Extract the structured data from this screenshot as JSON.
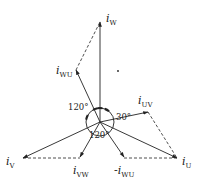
{
  "diagram": {
    "origin": [
      100,
      122
    ],
    "angle_circle_radius": 14,
    "colors": {
      "line": "#222222",
      "background": "#ffffff"
    },
    "phasors": [
      {
        "id": "iW",
        "main": "i",
        "sub": "W",
        "prefix": "",
        "tip": [
          100,
          22
        ],
        "label_pos": [
          106,
          22
        ],
        "style": "solid"
      },
      {
        "id": "iWU",
        "main": "i",
        "sub": "WU",
        "prefix": "",
        "tip": [
          76,
          70
        ],
        "label_pos": [
          56,
          74
        ],
        "style": "solid"
      },
      {
        "id": "iUV",
        "main": "i",
        "sub": "UV",
        "prefix": "",
        "tip": [
          148,
          112
        ],
        "label_pos": [
          138,
          104
        ],
        "style": "solid"
      },
      {
        "id": "iU",
        "main": "i",
        "sub": "U",
        "prefix": "",
        "tip": [
          177,
          158
        ],
        "label_pos": [
          182,
          165
        ],
        "style": "solid"
      },
      {
        "id": "iV",
        "main": "i",
        "sub": "V",
        "prefix": "",
        "tip": [
          23,
          158
        ],
        "label_pos": [
          6,
          165
        ],
        "style": "solid"
      },
      {
        "id": "iVW",
        "main": "i",
        "sub": "VW",
        "prefix": "",
        "tip": [
          80,
          157
        ],
        "label_pos": [
          73,
          174
        ],
        "style": "solid"
      },
      {
        "id": "niWU",
        "main": "i",
        "sub": "WU",
        "prefix": "-",
        "tip": [
          124,
          157
        ],
        "label_pos": [
          114,
          174
        ],
        "style": "solid"
      }
    ],
    "dashed_lines": [
      {
        "from": [
          76,
          70
        ],
        "to": [
          100,
          22
        ]
      },
      {
        "from": [
          148,
          112
        ],
        "to": [
          177,
          158
        ]
      },
      {
        "from": [
          23,
          158
        ],
        "to": [
          80,
          158
        ]
      },
      {
        "from": [
          124,
          158
        ],
        "to": [
          177,
          158
        ]
      }
    ],
    "angle_labels": [
      {
        "text": "120°",
        "pos": [
          68,
          110
        ]
      },
      {
        "text": "30°",
        "pos": [
          116,
          120
        ]
      },
      {
        "text": "120°",
        "pos": [
          89,
          138
        ]
      }
    ],
    "marker_dot": [
      118,
      71
    ]
  }
}
